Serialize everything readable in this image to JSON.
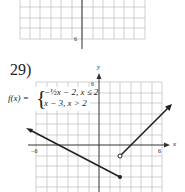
{
  "top_graph": {
    "y_min_label": "6"
  },
  "problem": {
    "number": "29)",
    "function_lhs": "f(x) =",
    "case1": "−½x − 2, x ≤ 2",
    "case2": "x − 3, x > 2",
    "x_axis_label": "x",
    "y_axis_label": "y",
    "tick_labels": {
      "x_neg": "−6",
      "x_pos": "6",
      "y_pos": "6"
    }
  }
}
